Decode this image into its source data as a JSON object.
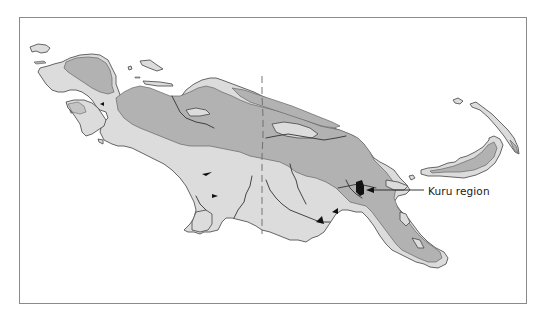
{
  "map": {
    "subject": "New Guinea",
    "labels": [
      {
        "id": "kuru",
        "text": "Kuru region"
      }
    ],
    "shading": {
      "light_land": "#dcdcdc",
      "dark_land": "#b2b2b2",
      "highlight_region": "#111111",
      "outline": "#555555",
      "background": "#ffffff"
    },
    "features": [
      "coastline",
      "highlands (dark shading)",
      "lowlands (light shading)",
      "rivers",
      "international border (dashed)",
      "Kuru region (black fill)",
      "offshore islands"
    ]
  }
}
